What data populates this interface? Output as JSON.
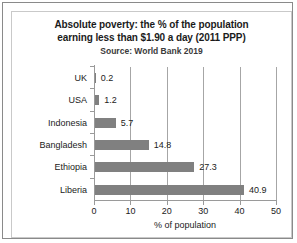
{
  "chart_data": {
    "type": "bar",
    "orientation": "horizontal",
    "title_lines": [
      "Absolute poverty: the % of the population",
      "earning less than $1.90 a day (2011 PPP)"
    ],
    "subtitle": "Source: World Bank 2019",
    "categories": [
      "UK",
      "USA",
      "Indonesia",
      "Bangladesh",
      "Ethiopia",
      "Liberia"
    ],
    "values": [
      0.2,
      1.2,
      5.7,
      14.8,
      27.3,
      40.9
    ],
    "value_labels": [
      "0.2",
      "1.2",
      "5.7",
      "14.8",
      "27.3",
      "40.9"
    ],
    "xlabel": "% of population",
    "ylabel": "",
    "xlim": [
      0,
      50
    ],
    "xticks": [
      0,
      10,
      20,
      30,
      40,
      50
    ],
    "xtick_labels": [
      "0",
      "10",
      "20",
      "30",
      "40",
      "50"
    ],
    "grid": "vertical",
    "legend": "none",
    "bar_color": "#808080",
    "gridline_color": "#a6a6a6",
    "axis_color": "#9a9a9a",
    "text_color": "#1b1b1b"
  }
}
